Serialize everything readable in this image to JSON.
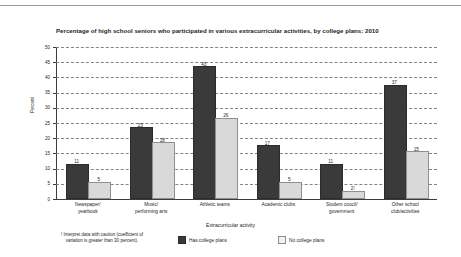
{
  "chart_data": {
    "type": "bar",
    "title": "Percentage of high school seniors who participated in various extracurricular activities, by college plans: 2010",
    "xlabel": "Extracurricular activity",
    "ylabel": "Percent",
    "ylim": [
      0,
      50
    ],
    "yticks": [
      0,
      5,
      10,
      15,
      20,
      25,
      30,
      35,
      40,
      45,
      50
    ],
    "grid": true,
    "legend_position": "bottom",
    "categories": [
      "Newspaper/\nyearbook",
      "Music/\nperforming arts",
      "Athletic teams",
      "Academic clubs",
      "Student coucil/\ngovernment",
      "Other school\nclub/activities"
    ],
    "category_lines": [
      [
        "Newspaper/",
        "yearbook"
      ],
      [
        "Music/",
        "performing arts"
      ],
      [
        "Athletic teams",
        ""
      ],
      [
        "Academic clubs",
        ""
      ],
      [
        "Student coucil/",
        "government"
      ],
      [
        "Other school",
        "club/activities"
      ]
    ],
    "series": [
      {
        "name": "Has college plans",
        "color": "#3a3a3a",
        "values": [
          11,
          23,
          43,
          17,
          11,
          37
        ],
        "labels": [
          "11",
          "23",
          "43",
          "17",
          "11",
          "37"
        ]
      },
      {
        "name": "No college plans",
        "color": "#d9d9d9",
        "values": [
          5,
          18,
          26,
          5,
          2,
          15
        ],
        "labels": [
          "5",
          "18",
          "26",
          "5",
          "2!",
          "15"
        ]
      }
    ],
    "footnote": "! Interpret data with caution (coefficient of variation is greater than 30 percent).",
    "footnote_lines": [
      "! Interpret data with caution (coefficient of",
      "variation is greater than 30 percent)."
    ]
  },
  "legend": {
    "items": [
      {
        "label": "Has college plans",
        "swatch": "dark"
      },
      {
        "label": "No college plans",
        "swatch": "light"
      }
    ]
  }
}
